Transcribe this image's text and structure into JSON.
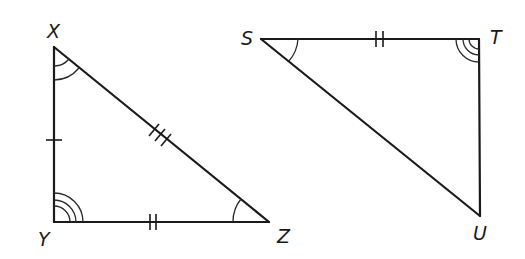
{
  "diagram": {
    "type": "congruent-triangles",
    "triangles": [
      {
        "name": "XYZ",
        "vertices": {
          "X": {
            "label": "X",
            "x": 54,
            "y": 47
          },
          "Y": {
            "label": "Y",
            "x": 54,
            "y": 222
          },
          "Z": {
            "label": "Z",
            "x": 269,
            "y": 222
          }
        },
        "side_marks": {
          "XY": 1,
          "YZ": 2,
          "XZ": 3
        },
        "angle_marks": {
          "X": 2,
          "Y": 3,
          "Z": 1
        }
      },
      {
        "name": "STU",
        "vertices": {
          "S": {
            "label": "S",
            "x": 261,
            "y": 39
          },
          "T": {
            "label": "T",
            "x": 479,
            "y": 39
          },
          "U": {
            "label": "U",
            "x": 480,
            "y": 216
          }
        },
        "side_marks": {
          "ST": 2
        },
        "angle_marks": {
          "S": 1,
          "T": 3
        }
      }
    ],
    "labels": {
      "X": "X",
      "Y": "Y",
      "Z": "Z",
      "S": "S",
      "T": "T",
      "U": "U"
    },
    "colors": {
      "stroke": "#1a1a1a",
      "background": "#ffffff"
    }
  }
}
